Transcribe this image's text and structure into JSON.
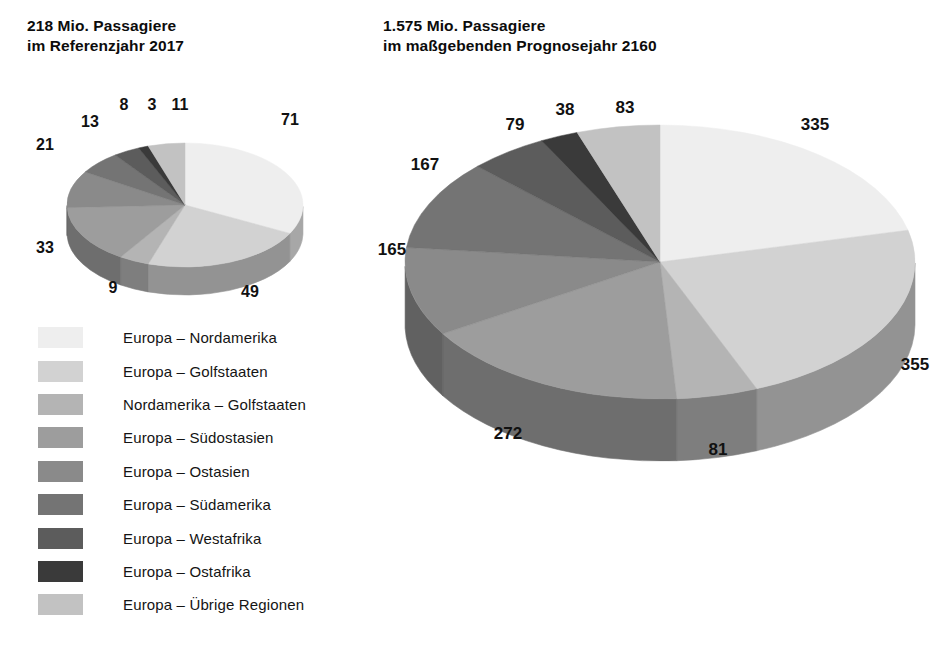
{
  "chart_data": [
    {
      "type": "pie",
      "title": "218 Mio. Passagiere\nim Referenzjahr 2017",
      "total": 218,
      "unit": "Mio. Passagiere",
      "year": "2017",
      "categories": [
        "Europa – Nordamerika",
        "Europa – Golfstaaten",
        "Nordamerika – Golfstaaten",
        "Europa – Südostasien",
        "Europa – Ostasien",
        "Europa – Südamerika",
        "Europa – Westafrika",
        "Europa – Ostafrika",
        "Europa – Übrige Regionen"
      ],
      "values": [
        71,
        49,
        9,
        33,
        21,
        13,
        8,
        3,
        11
      ],
      "labels": [
        "71",
        "49",
        "9",
        "33",
        "21",
        "13",
        "8",
        "3",
        "11"
      ],
      "colors": [
        "#eeeeee",
        "#d2d2d2",
        "#b4b4b4",
        "#9d9d9d",
        "#8a8a8a",
        "#747474",
        "#5c5c5c",
        "#3a3a3a",
        "#c2c2c2"
      ],
      "legend_position": "below-left",
      "grid": false
    },
    {
      "type": "pie",
      "title": "1.575 Mio. Passagiere\nim maßgebenden Prognosejahr 2160",
      "total": 1575,
      "unit": "Mio. Passagiere",
      "year": "2160",
      "categories": [
        "Europa – Nordamerika",
        "Europa – Golfstaaten",
        "Nordamerika – Golfstaaten",
        "Europa – Südostasien",
        "Europa – Ostasien",
        "Europa – Südamerika",
        "Europa – Westafrika",
        "Europa – Ostafrika",
        "Europa – Übrige Regionen"
      ],
      "values": [
        335,
        355,
        81,
        272,
        165,
        167,
        79,
        38,
        83
      ],
      "labels": [
        "335",
        "355",
        "81",
        "272",
        "165",
        "167",
        "79",
        "38",
        "83"
      ],
      "colors": [
        "#eeeeee",
        "#d2d2d2",
        "#b4b4b4",
        "#9d9d9d",
        "#8a8a8a",
        "#747474",
        "#5c5c5c",
        "#3a3a3a",
        "#c2c2c2"
      ],
      "legend_position": "below-left",
      "grid": false
    }
  ],
  "titles": {
    "left": "218 Mio. Passagiere\nim Referenzjahr 2017",
    "right": "1.575 Mio. Passagiere\nim maßgebenden Prognosejahr 2160"
  },
  "legend": {
    "items": [
      {
        "label": "Europa – Nordamerika",
        "color": "#eeeeee"
      },
      {
        "label": "Europa – Golfstaaten",
        "color": "#d2d2d2"
      },
      {
        "label": "Nordamerika – Golfstaaten",
        "color": "#b4b4b4"
      },
      {
        "label": "Europa – Südostasien",
        "color": "#9d9d9d"
      },
      {
        "label": "Europa – Ostasien",
        "color": "#8a8a8a"
      },
      {
        "label": "Europa – Südamerika",
        "color": "#747474"
      },
      {
        "label": "Europa – Westafrika",
        "color": "#5c5c5c"
      },
      {
        "label": "Europa – Ostafrika",
        "color": "#3a3a3a"
      },
      {
        "label": "Europa – Übrige Regionen",
        "color": "#c2c2c2"
      }
    ]
  },
  "pie_geometry": {
    "left": {
      "cx": 165,
      "cy": 110,
      "rx": 118,
      "ry": 62,
      "depth": 28,
      "start_angle": -90
    },
    "right": {
      "cx": 290,
      "cy": 167,
      "rx": 255,
      "ry": 137,
      "depth": 62,
      "start_angle": -90
    }
  },
  "label_positions": {
    "left": [
      [
        290,
        120
      ],
      [
        250,
        292
      ],
      [
        113,
        288
      ],
      [
        45,
        248
      ],
      [
        45,
        145
      ],
      [
        90,
        122
      ],
      [
        124,
        105
      ],
      [
        152,
        105
      ],
      [
        180,
        105
      ]
    ],
    "right": [
      [
        815,
        125
      ],
      [
        915,
        365
      ],
      [
        718,
        450
      ],
      [
        508,
        434
      ],
      [
        392,
        250
      ],
      [
        425,
        165
      ],
      [
        515,
        125
      ],
      [
        565,
        110
      ],
      [
        625,
        108
      ]
    ]
  }
}
